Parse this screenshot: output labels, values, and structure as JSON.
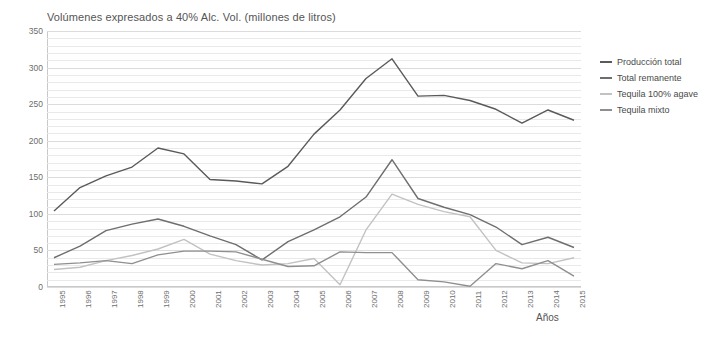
{
  "chart_data": {
    "type": "line",
    "title": "Volúmenes expresados a 40% Alc. Vol. (millones de litros)",
    "xlabel": "Años",
    "ylabel": "",
    "grid": true,
    "legend_position": "right",
    "ylim": [
      0,
      350
    ],
    "yticks": [
      0,
      50,
      100,
      150,
      200,
      250,
      300,
      350
    ],
    "categories": [
      "1995",
      "1996",
      "1997",
      "1998",
      "1999",
      "2000",
      "2001",
      "2002",
      "2003",
      "2004",
      "2005",
      "2006",
      "2007",
      "2008",
      "2009",
      "2010",
      "2011",
      "2012",
      "2013",
      "2014",
      "2015"
    ],
    "series": [
      {
        "name": "Producción total",
        "color": "#5a5a5a",
        "values": [
          104,
          136,
          152,
          164,
          190,
          182,
          147,
          145,
          141,
          165,
          209,
          242,
          285,
          312,
          261,
          262,
          255,
          243,
          224,
          242,
          228
        ]
      },
      {
        "name": "Total remanente",
        "color": "#6e6e6e",
        "values": [
          40,
          56,
          77,
          86,
          93,
          83,
          70,
          58,
          37,
          62,
          78,
          96,
          123,
          174,
          121,
          109,
          99,
          82,
          58,
          68,
          54
        ]
      },
      {
        "name": "Tequila 100% agave",
        "color": "#c2c2c2",
        "values": [
          24,
          27,
          36,
          43,
          52,
          65,
          45,
          36,
          30,
          32,
          39,
          3,
          78,
          127,
          113,
          103,
          96,
          50,
          33,
          32,
          40
        ]
      },
      {
        "name": "Tequila mixto",
        "color": "#8f8f8f",
        "values": [
          31,
          33,
          36,
          32,
          44,
          49,
          49,
          48,
          38,
          28,
          29,
          48,
          47,
          47,
          10,
          7,
          1,
          32,
          25,
          36,
          15
        ]
      }
    ]
  },
  "legend": {
    "items": [
      {
        "label": "Producción total"
      },
      {
        "label": "Total remanente"
      },
      {
        "label": "Tequila 100% agave"
      },
      {
        "label": "Tequila mixto"
      }
    ]
  }
}
